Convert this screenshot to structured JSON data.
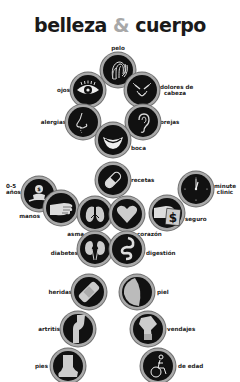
{
  "title": {
    "part1": "belleza",
    "amp": "&",
    "part2": "cuerpo"
  },
  "colors": {
    "circle_fill": "#111111",
    "ring": "#a9a9a9",
    "icon": "#c8c8c8",
    "amp": "#a8a8a8",
    "text": "#222222"
  },
  "items": [
    {
      "id": "pelo",
      "label": "pelo",
      "icon": "hair-icon"
    },
    {
      "id": "ojos",
      "label": "ojos",
      "icon": "eye-icon"
    },
    {
      "id": "dolores",
      "label_line1": "dolores de",
      "label_line2": "cabeza",
      "icon": "headache-icon"
    },
    {
      "id": "alergias",
      "label": "alergias",
      "icon": "nose-icon"
    },
    {
      "id": "orejas",
      "label": "orejas",
      "icon": "ear-icon"
    },
    {
      "id": "boca",
      "label": "boca",
      "icon": "mouth-icon"
    },
    {
      "id": "recetas",
      "label": "recetas",
      "icon": "pill-icon"
    },
    {
      "id": "ninos",
      "label_line1": "0-5",
      "label_line2": "años",
      "icon": "baby-icon"
    },
    {
      "id": "minute",
      "label_line1": "minute",
      "label_line2": "clinic",
      "icon": "clock-icon"
    },
    {
      "id": "manos",
      "label": "manos",
      "icon": "hand-icon"
    },
    {
      "id": "seguro",
      "label": "seguro",
      "icon": "insurance-dollar-icon"
    },
    {
      "id": "asma",
      "label": "asma",
      "icon": "lungs-icon"
    },
    {
      "id": "corazon",
      "label": "corazón",
      "icon": "heart-icon"
    },
    {
      "id": "diabetes",
      "label": "diabetes",
      "icon": "kidneys-icon"
    },
    {
      "id": "digestion",
      "label": "digestión",
      "icon": "digestion-icon"
    },
    {
      "id": "heridas",
      "label": "heridas",
      "icon": "bandage-icon"
    },
    {
      "id": "piel",
      "label": "piel",
      "icon": "skin-icon"
    },
    {
      "id": "artritis",
      "label": "artritis",
      "icon": "joint-icon"
    },
    {
      "id": "vendajes",
      "label": "vendajes",
      "icon": "knee-brace-icon"
    },
    {
      "id": "pies",
      "label": "pies",
      "icon": "foot-icon"
    },
    {
      "id": "edad",
      "label": "de edad",
      "icon": "wheelchair-icon"
    }
  ]
}
